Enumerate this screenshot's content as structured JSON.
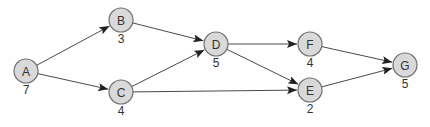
{
  "diagram": {
    "type": "directed-graph",
    "node_radius": 12,
    "colors": {
      "node_fill": "#d9d9d9",
      "node_stroke": "#707070",
      "edge": "#4a4a4a",
      "text": "#333333"
    },
    "nodes": [
      {
        "id": "A",
        "label": "A",
        "weight": "7",
        "x": 26,
        "y": 71
      },
      {
        "id": "B",
        "label": "B",
        "weight": "3",
        "x": 121,
        "y": 20
      },
      {
        "id": "C",
        "label": "C",
        "weight": "4",
        "x": 121,
        "y": 92
      },
      {
        "id": "D",
        "label": "D",
        "weight": "5",
        "x": 216,
        "y": 44
      },
      {
        "id": "E",
        "label": "E",
        "weight": "2",
        "x": 310,
        "y": 90
      },
      {
        "id": "F",
        "label": "F",
        "weight": "4",
        "x": 310,
        "y": 44
      },
      {
        "id": "G",
        "label": "G",
        "weight": "5",
        "x": 405,
        "y": 65
      }
    ],
    "edges": [
      {
        "from": "A",
        "to": "B"
      },
      {
        "from": "A",
        "to": "C"
      },
      {
        "from": "B",
        "to": "D"
      },
      {
        "from": "C",
        "to": "D"
      },
      {
        "from": "C",
        "to": "E"
      },
      {
        "from": "D",
        "to": "F"
      },
      {
        "from": "D",
        "to": "E"
      },
      {
        "from": "F",
        "to": "G"
      },
      {
        "from": "E",
        "to": "G"
      }
    ]
  }
}
